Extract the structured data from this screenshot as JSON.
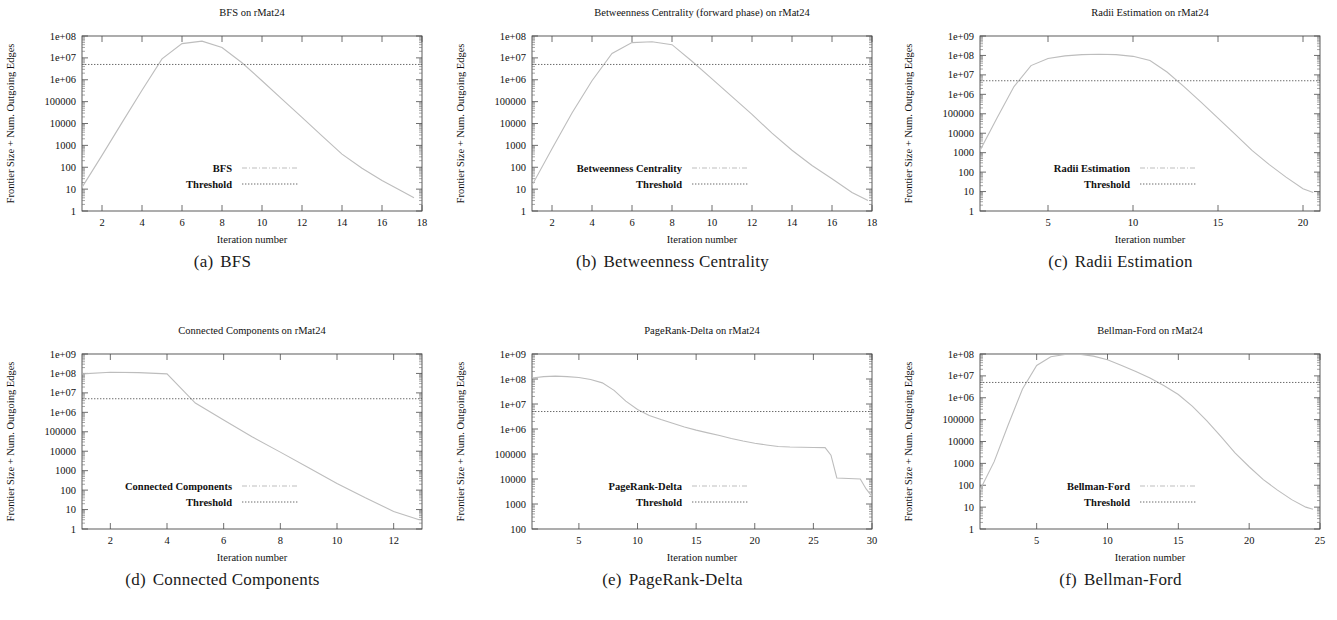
{
  "figure": {
    "shared_ylabel": "Frontier Size + Num. Outgoing Edges",
    "shared_xlabel": "Iteration number",
    "threshold_legend_label": "Threshold",
    "dataset": "rMat24"
  },
  "panels": [
    {
      "letter": "(a)",
      "caption": "BFS",
      "title": "BFS on rMat24",
      "legend_label": "BFS"
    },
    {
      "letter": "(b)",
      "caption": "Betweenness Centrality",
      "title": "Betweenness Centrality (forward phase) on rMat24",
      "legend_label": "Betweenness Centrality"
    },
    {
      "letter": "(c)",
      "caption": "Radii Estimation",
      "title": "Radii Estimation on rMat24",
      "legend_label": "Radii Estimation"
    },
    {
      "letter": "(d)",
      "caption": "Connected Components",
      "title": "Connected Components on rMat24",
      "legend_label": "Connected Components"
    },
    {
      "letter": "(e)",
      "caption": "PageRank-Delta",
      "title": "PageRank-Delta on rMat24",
      "legend_label": "PageRank-Delta"
    },
    {
      "letter": "(f)",
      "caption": "Bellman-Ford",
      "title": "Bellman-Ford on rMat24",
      "legend_label": "Bellman-Ford"
    }
  ],
  "chart_data": [
    {
      "type": "line",
      "panel": "a",
      "title": "BFS on rMat24",
      "xlabel": "Iteration number",
      "ylabel": "Frontier Size + Num. Outgoing Edges",
      "yscale": "log",
      "ylim": [
        1,
        100000000
      ],
      "ytick_labels": [
        "1",
        "10",
        "100",
        "1000",
        "10000",
        "100000",
        "1e+06",
        "1e+07",
        "1e+08"
      ],
      "ytick_values": [
        1,
        10,
        100,
        1000,
        10000,
        100000,
        1000000,
        10000000,
        100000000
      ],
      "xlim": [
        1,
        18
      ],
      "xtick_labels": [
        "2",
        "4",
        "6",
        "8",
        "10",
        "12",
        "14",
        "16",
        "18"
      ],
      "xtick_values": [
        2,
        4,
        6,
        8,
        10,
        12,
        14,
        16,
        18
      ],
      "grid": false,
      "legend_position": "inside-lower-left",
      "series": [
        {
          "name": "BFS",
          "x": [
            1,
            2,
            3,
            4,
            5,
            6,
            7,
            8,
            9,
            10,
            11,
            12,
            13,
            14,
            15,
            16,
            17,
            17.6
          ],
          "values": [
            12,
            350,
            11000,
            330000,
            9000000,
            45000000,
            58000000,
            30000000,
            6000000,
            900000,
            130000,
            19000,
            2700,
            400,
            90,
            25,
            8,
            4
          ]
        },
        {
          "name": "Threshold",
          "x": [
            1,
            18
          ],
          "values": [
            5000000,
            5000000
          ]
        }
      ]
    },
    {
      "type": "line",
      "panel": "b",
      "title": "Betweenness Centrality (forward phase) on rMat24",
      "xlabel": "Iteration number",
      "ylabel": "Frontier Size + Num. Outgoing Edges",
      "yscale": "log",
      "ylim": [
        1,
        100000000
      ],
      "ytick_labels": [
        "1",
        "10",
        "100",
        "1000",
        "10000",
        "100000",
        "1e+06",
        "1e+07",
        "1e+08"
      ],
      "ytick_values": [
        1,
        10,
        100,
        1000,
        10000,
        100000,
        1000000,
        10000000,
        100000000
      ],
      "xlim": [
        1,
        18
      ],
      "xtick_labels": [
        "2",
        "4",
        "6",
        "8",
        "10",
        "12",
        "14",
        "16",
        "18"
      ],
      "xtick_values": [
        2,
        4,
        6,
        8,
        10,
        12,
        14,
        16,
        18
      ],
      "grid": false,
      "legend_position": "inside-lower-left",
      "series": [
        {
          "name": "Betweenness Centrality",
          "x": [
            1,
            2,
            3,
            4,
            5,
            6,
            7,
            8,
            9,
            10,
            11,
            12,
            13,
            14,
            15,
            16,
            17,
            17.8
          ],
          "values": [
            15,
            700,
            30000,
            900000,
            16000000,
            50000000,
            55000000,
            40000000,
            7000000,
            1100000,
            170000,
            26000,
            3600,
            600,
            120,
            30,
            7,
            3
          ]
        },
        {
          "name": "Threshold",
          "x": [
            1,
            18
          ],
          "values": [
            5000000,
            5000000
          ]
        }
      ]
    },
    {
      "type": "line",
      "panel": "c",
      "title": "Radii Estimation on rMat24",
      "xlabel": "Iteration number",
      "ylabel": "Frontier Size + Num. Outgoing Edges",
      "yscale": "log",
      "ylim": [
        1,
        1000000000
      ],
      "ytick_labels": [
        "1",
        "10",
        "100",
        "1000",
        "10000",
        "100000",
        "1e+06",
        "1e+07",
        "1e+08",
        "1e+09"
      ],
      "ytick_values": [
        1,
        10,
        100,
        1000,
        10000,
        100000,
        1000000,
        10000000,
        100000000,
        1000000000
      ],
      "xlim": [
        1,
        21
      ],
      "xtick_labels": [
        "5",
        "10",
        "15",
        "20"
      ],
      "xtick_values": [
        5,
        10,
        15,
        20
      ],
      "grid": false,
      "legend_position": "inside-lower-left",
      "series": [
        {
          "name": "Radii Estimation",
          "x": [
            1,
            2,
            3,
            4,
            5,
            6,
            7,
            8,
            9,
            10,
            11,
            12,
            13,
            14,
            15,
            16,
            17,
            18,
            19,
            20,
            20.6
          ],
          "values": [
            1300,
            60000,
            2500000,
            30000000,
            70000000,
            95000000,
            110000000,
            115000000,
            110000000,
            90000000,
            55000000,
            14000000,
            2500000,
            400000,
            60000,
            9000,
            1300,
            250,
            55,
            14,
            9
          ]
        },
        {
          "name": "Threshold",
          "x": [
            1,
            21
          ],
          "values": [
            5000000,
            5000000
          ]
        }
      ]
    },
    {
      "type": "line",
      "panel": "d",
      "title": "Connected Components on rMat24",
      "xlabel": "Iteration number",
      "ylabel": "Frontier Size + Num. Outgoing Edges",
      "yscale": "log",
      "ylim": [
        1,
        1000000000
      ],
      "ytick_labels": [
        "1",
        "10",
        "100",
        "1000",
        "10000",
        "100000",
        "1e+06",
        "1e+07",
        "1e+08",
        "1e+09"
      ],
      "ytick_values": [
        1,
        10,
        100,
        1000,
        10000,
        100000,
        1000000,
        10000000,
        100000000,
        1000000000
      ],
      "xlim": [
        1,
        13
      ],
      "xtick_labels": [
        "2",
        "4",
        "6",
        "8",
        "10",
        "12"
      ],
      "xtick_values": [
        2,
        4,
        6,
        8,
        10,
        12
      ],
      "grid": false,
      "legend_position": "inside-lower-left",
      "series": [
        {
          "name": "Connected Components",
          "x": [
            1,
            2,
            3,
            4,
            5,
            6,
            7,
            8,
            9,
            10,
            11,
            12,
            12.9
          ],
          "values": [
            95000000,
            115000000,
            110000000,
            95000000,
            3000000,
            400000,
            55000,
            9000,
            1400,
            220,
            40,
            8,
            3
          ]
        },
        {
          "name": "Threshold",
          "x": [
            1,
            13
          ],
          "values": [
            5000000,
            5000000
          ]
        }
      ]
    },
    {
      "type": "line",
      "panel": "e",
      "title": "PageRank-Delta on rMat24",
      "xlabel": "Iteration number",
      "ylabel": "Frontier Size + Num. Outgoing Edges",
      "yscale": "log",
      "ylim": [
        100,
        1000000000
      ],
      "ytick_labels": [
        "100",
        "1000",
        "10000",
        "100000",
        "1e+06",
        "1e+07",
        "1e+08",
        "1e+09"
      ],
      "ytick_values": [
        100,
        1000,
        10000,
        100000,
        1000000,
        10000000,
        100000000,
        1000000000
      ],
      "xlim": [
        1,
        30
      ],
      "xtick_labels": [
        "5",
        "10",
        "15",
        "20",
        "25",
        "30"
      ],
      "xtick_values": [
        5,
        10,
        15,
        20,
        25,
        30
      ],
      "grid": false,
      "legend_position": "inside-lower-left",
      "series": [
        {
          "name": "PageRank-Delta",
          "x": [
            1,
            2,
            3,
            4,
            5,
            6,
            7,
            8,
            9,
            10,
            11,
            12,
            13,
            14,
            15,
            16,
            17,
            18,
            19,
            20,
            21,
            22,
            23,
            24,
            25,
            26,
            26.5,
            27,
            28,
            29,
            29.5,
            30
          ],
          "values": [
            110000000,
            125000000,
            130000000,
            125000000,
            115000000,
            95000000,
            70000000,
            35000000,
            13000000,
            6000000,
            3500000,
            2400000,
            1700000,
            1200000,
            900000,
            700000,
            550000,
            420000,
            330000,
            270000,
            230000,
            200000,
            190000,
            185000,
            182000,
            180000,
            90000,
            11000,
            10500,
            10000,
            4000,
            2000
          ]
        },
        {
          "name": "Threshold",
          "x": [
            1,
            30
          ],
          "values": [
            5000000,
            5000000
          ]
        }
      ]
    },
    {
      "type": "line",
      "panel": "f",
      "title": "Bellman-Ford on rMat24",
      "xlabel": "Iteration number",
      "ylabel": "Frontier Size + Num. Outgoing Edges",
      "yscale": "log",
      "ylim": [
        1,
        100000000
      ],
      "ytick_labels": [
        "1",
        "10",
        "100",
        "1000",
        "10000",
        "100000",
        "1e+06",
        "1e+07",
        "1e+08"
      ],
      "ytick_values": [
        1,
        10,
        100,
        1000,
        10000,
        100000,
        1000000,
        10000000,
        100000000
      ],
      "xlim": [
        1,
        25
      ],
      "xtick_labels": [
        "5",
        "10",
        "15",
        "20",
        "25"
      ],
      "xtick_values": [
        5,
        10,
        15,
        20,
        25
      ],
      "grid": false,
      "legend_position": "inside-lower-left",
      "series": [
        {
          "name": "Bellman-Ford",
          "x": [
            1,
            2,
            3,
            4,
            5,
            6,
            7,
            8,
            9,
            10,
            11,
            12,
            13,
            14,
            15,
            16,
            17,
            18,
            19,
            20,
            21,
            22,
            23,
            24,
            24.5
          ],
          "values": [
            60,
            1200,
            60000,
            2500000,
            30000000,
            75000000,
            95000000,
            97000000,
            80000000,
            55000000,
            30000000,
            16000000,
            8000000,
            3500000,
            1400000,
            400000,
            90000,
            17000,
            3000,
            700,
            180,
            60,
            22,
            10,
            8
          ]
        },
        {
          "name": "Threshold",
          "x": [
            1,
            25
          ],
          "values": [
            5000000,
            5000000
          ]
        }
      ]
    }
  ]
}
